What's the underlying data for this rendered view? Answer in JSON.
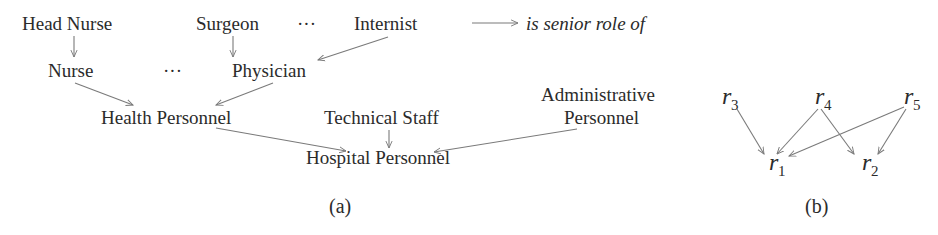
{
  "diagram_a": {
    "caption": "(a)",
    "legend": {
      "text": "is senior role of",
      "icon": "right-arrow-icon"
    },
    "nodes": {
      "head_nurse": "Head Nurse",
      "surgeon": "Surgeon",
      "dots_top": "···",
      "internist": "Internist",
      "nurse": "Nurse",
      "dots_mid": "···",
      "physician": "Physician",
      "health_personnel": "Health Personnel",
      "technical_staff": "Technical Staff",
      "administrative_personnel_line1": "Administrative",
      "administrative_personnel_line2": "Personnel",
      "hospital_personnel": "Hospital Personnel"
    },
    "edges": [
      {
        "from": "Head Nurse",
        "to": "Nurse"
      },
      {
        "from": "Surgeon",
        "to": "Physician"
      },
      {
        "from": "Internist",
        "to": "Physician"
      },
      {
        "from": "Nurse",
        "to": "Health Personnel"
      },
      {
        "from": "Physician",
        "to": "Health Personnel"
      },
      {
        "from": "Health Personnel",
        "to": "Hospital Personnel"
      },
      {
        "from": "Technical Staff",
        "to": "Hospital Personnel"
      },
      {
        "from": "Administrative Personnel",
        "to": "Hospital Personnel"
      }
    ]
  },
  "diagram_b": {
    "caption": "(b)",
    "nodes": {
      "r3": {
        "base": "r",
        "sub": "3"
      },
      "r4": {
        "base": "r",
        "sub": "4"
      },
      "r5": {
        "base": "r",
        "sub": "5"
      },
      "r1": {
        "base": "r",
        "sub": "1"
      },
      "r2": {
        "base": "r",
        "sub": "2"
      }
    },
    "edges": [
      {
        "from": "r3",
        "to": "r1"
      },
      {
        "from": "r4",
        "to": "r1"
      },
      {
        "from": "r4",
        "to": "r2"
      },
      {
        "from": "r5",
        "to": "r1"
      },
      {
        "from": "r5",
        "to": "r2"
      }
    ]
  }
}
